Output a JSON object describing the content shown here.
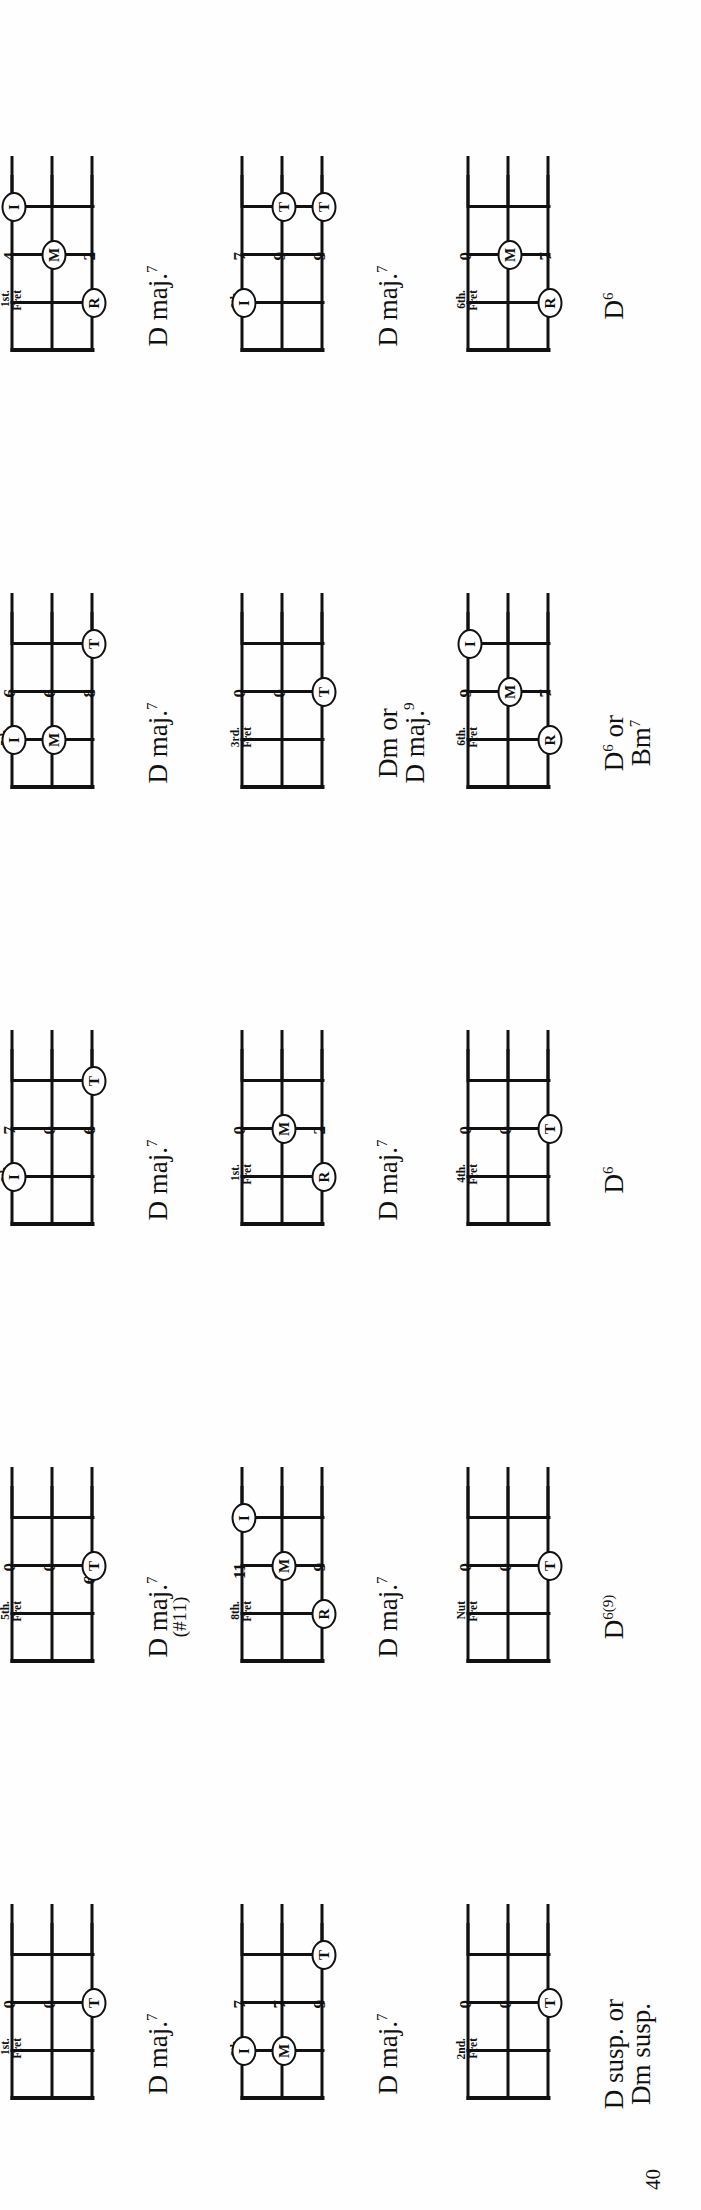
{
  "page": {
    "number": "40"
  },
  "legend": {
    "finger_symbols": {
      "I": "index",
      "M": "middle",
      "R": "ring",
      "T": "thumb"
    },
    "fret_caption_line2": "Fret"
  },
  "chords": [
    {
      "id": "d-maj7-1st",
      "name_main": "D maj.",
      "name_sup": "7",
      "name_line2": "",
      "name_paren": "",
      "fret_caption": "1st.",
      "fret_numbers": [
        "0",
        "0",
        "2"
      ],
      "markers": [
        {
          "label": "T",
          "string": 2,
          "fret": 1
        }
      ]
    },
    {
      "id": "d-maj7-sharp11-5th",
      "name_main": "D maj.",
      "name_sup": "7",
      "name_line2": "",
      "name_paren": "(#11)",
      "fret_caption": "5th.",
      "fret_numbers": [
        "0",
        "0",
        "6½"
      ],
      "markers": [
        {
          "label": "T",
          "string": 2,
          "fret": 1
        }
      ]
    },
    {
      "id": "d-maj7-6th-7-0-6",
      "name_main": "D maj.",
      "name_sup": "7",
      "name_line2": "",
      "name_paren": "",
      "fret_caption": "6th.",
      "fret_numbers": [
        "7",
        "0",
        "6"
      ],
      "markers": [
        {
          "label": "I",
          "string": 0,
          "fret": 0
        },
        {
          "label": "T",
          "string": 2,
          "fret": 2
        }
      ]
    },
    {
      "id": "d-maj7-5th-6-6-8",
      "name_main": "D maj.",
      "name_sup": "7",
      "name_line2": "",
      "name_paren": "",
      "fret_caption": "5th.",
      "fret_numbers": [
        "6",
        "6",
        "8"
      ],
      "markers": [
        {
          "label": "I",
          "string": 0,
          "fret": 0
        },
        {
          "label": "M",
          "string": 1,
          "fret": 0
        },
        {
          "label": "T",
          "string": 2,
          "fret": 2
        }
      ]
    },
    {
      "id": "d-maj7-1st-4-3-2",
      "name_main": "D maj.",
      "name_sup": "7",
      "name_line2": "",
      "name_paren": "",
      "fret_caption": "1st.",
      "fret_numbers": [
        "4",
        "3",
        "2"
      ],
      "markers": [
        {
          "label": "I",
          "string": 0,
          "fret": 2
        },
        {
          "label": "M",
          "string": 1,
          "fret": 1
        },
        {
          "label": "R",
          "string": 2,
          "fret": 0
        }
      ]
    },
    {
      "id": "d-maj7-6th-7-7-9",
      "name_main": "D maj.",
      "name_sup": "7",
      "name_line2": "",
      "name_paren": "",
      "fret_caption": "6th.",
      "fret_numbers": [
        "7",
        "7",
        "9"
      ],
      "markers": [
        {
          "label": "I",
          "string": 0,
          "fret": 0
        },
        {
          "label": "M",
          "string": 1,
          "fret": 0
        },
        {
          "label": "T",
          "string": 2,
          "fret": 2
        }
      ]
    },
    {
      "id": "d-maj7-8th-11-10-9",
      "name_main": "D maj.",
      "name_sup": "7",
      "name_line2": "",
      "name_paren": "",
      "fret_caption": "8th.",
      "fret_numbers": [
        "11",
        "10",
        "9"
      ],
      "markers": [
        {
          "label": "I",
          "string": 0,
          "fret": 2
        },
        {
          "label": "M",
          "string": 1,
          "fret": 1
        },
        {
          "label": "R",
          "string": 2,
          "fret": 0
        }
      ]
    },
    {
      "id": "d-maj7-1st-0-3-2",
      "name_main": "D maj.",
      "name_sup": "7",
      "name_line2": "",
      "name_paren": "",
      "fret_caption": "1st.",
      "fret_numbers": [
        "0",
        "3",
        "2"
      ],
      "markers": [
        {
          "label": "M",
          "string": 1,
          "fret": 1
        },
        {
          "label": "R",
          "string": 2,
          "fret": 0
        }
      ]
    },
    {
      "id": "dm-or-dmaj9-3rd",
      "name_main": "Dm or",
      "name_sup": "",
      "name_line2": "D maj.",
      "name_line2_sup": "9",
      "name_paren": "",
      "fret_caption": "3rd.",
      "fret_numbers": [
        "0",
        "0",
        "4"
      ],
      "markers": [
        {
          "label": "T",
          "string": 2,
          "fret": 1
        }
      ]
    },
    {
      "id": "d-maj7-6th-7-9-9",
      "name_main": "D maj.",
      "name_sup": "7",
      "name_line2": "",
      "name_paren": "",
      "fret_caption": "6th.",
      "fret_numbers": [
        "7",
        "9",
        "9"
      ],
      "markers": [
        {
          "label": "I",
          "string": 0,
          "fret": 0
        },
        {
          "label": "T",
          "string": 1,
          "fret": 2
        },
        {
          "label": "T",
          "string": 2,
          "fret": 2
        }
      ]
    },
    {
      "id": "d-susp-dm-susp-2nd",
      "name_main": "D susp. or",
      "name_sup": "",
      "name_line2": "Dm susp.",
      "name_paren": "",
      "fret_caption": "2nd.",
      "fret_numbers": [
        "0",
        "0",
        "3"
      ],
      "markers": [
        {
          "label": "T",
          "string": 2,
          "fret": 1
        }
      ]
    },
    {
      "id": "d-6-9-nut",
      "name_main": "D",
      "name_sup": "6(9)",
      "name_line2": "",
      "name_paren": "",
      "fret_caption": "Nut",
      "fret_numbers": [
        "0",
        "0",
        "1"
      ],
      "markers": [
        {
          "label": "T",
          "string": 2,
          "fret": 1
        }
      ]
    },
    {
      "id": "d-6-4th",
      "name_main": "D",
      "name_sup": "6",
      "name_line2": "",
      "name_paren": "",
      "fret_caption": "4th.",
      "fret_numbers": [
        "0",
        "0",
        "5"
      ],
      "markers": [
        {
          "label": "T",
          "string": 2,
          "fret": 1
        }
      ]
    },
    {
      "id": "d6-or-bm7-6th",
      "name_main": "D",
      "name_sup": "6",
      "name_main_tail": " or",
      "name_line2": "Bm",
      "name_line2_sup": "7",
      "name_paren": "",
      "fret_caption": "6th.",
      "fret_numbers": [
        "9",
        "8",
        "7"
      ],
      "markers": [
        {
          "label": "I",
          "string": 0,
          "fret": 2
        },
        {
          "label": "M",
          "string": 1,
          "fret": 1
        },
        {
          "label": "R",
          "string": 2,
          "fret": 0
        }
      ]
    },
    {
      "id": "d6-6th-0-8-7",
      "name_main": "D",
      "name_sup": "6",
      "name_line2": "",
      "name_paren": "",
      "fret_caption": "6th.",
      "fret_numbers": [
        "0",
        "8",
        "7"
      ],
      "markers": [
        {
          "label": "M",
          "string": 1,
          "fret": 1
        },
        {
          "label": "R",
          "string": 2,
          "fret": 0
        }
      ]
    }
  ]
}
